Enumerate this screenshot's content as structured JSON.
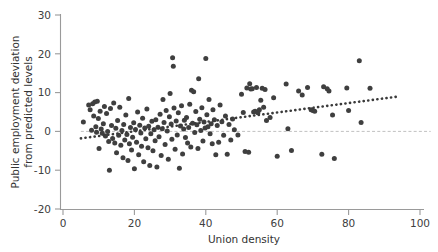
{
  "chart_data": {
    "type": "scatter",
    "title": "",
    "xlabel": "Union density",
    "ylabel": "Public employment deviation from predicted levels",
    "ylabel_line1": "Public employment deviation",
    "ylabel_line2": "from predicted levels",
    "xlim": [
      0,
      100
    ],
    "ylim": [
      -20,
      30
    ],
    "xticks": [
      0,
      20,
      40,
      60,
      80,
      100
    ],
    "yticks": [
      -20,
      -10,
      0,
      10,
      20,
      30
    ],
    "xtick_labels": [
      "0",
      "20",
      "40",
      "60",
      "80",
      "100"
    ],
    "ytick_labels": [
      "-20",
      "-10",
      "0",
      "10",
      "20",
      "30"
    ],
    "grid": false,
    "legend": "none",
    "marker_color": "#3f3f3f",
    "marker_size": 5,
    "reference_line": {
      "type": "horizontal-dashed",
      "y": 0,
      "color": "#b9b9b9",
      "x_start": 5,
      "x_end": 103
    },
    "trend_line": {
      "type": "dotted-linear-fit",
      "color": "#3a3a3a",
      "x_start": 5,
      "y_start": -1.8,
      "x_end": 94,
      "y_end": 9.0
    },
    "points": [
      [
        5.7,
        2.4
      ],
      [
        7.2,
        6.8
      ],
      [
        7.6,
        5.6
      ],
      [
        8.0,
        0.3
      ],
      [
        8.3,
        7.1
      ],
      [
        8.6,
        4.0
      ],
      [
        8.9,
        7.6
      ],
      [
        9.2,
        1.2
      ],
      [
        9.4,
        -0.2
      ],
      [
        9.6,
        7.8
      ],
      [
        9.9,
        3.3
      ],
      [
        10.1,
        -4.4
      ],
      [
        10.4,
        5.2
      ],
      [
        10.7,
        0.6
      ],
      [
        11.0,
        -0.5
      ],
      [
        11.3,
        2.0
      ],
      [
        11.6,
        6.4
      ],
      [
        11.9,
        -1.2
      ],
      [
        12.2,
        4.6
      ],
      [
        12.5,
        0.0
      ],
      [
        12.8,
        -2.6
      ],
      [
        13.0,
        -10.0
      ],
      [
        13.3,
        5.9
      ],
      [
        13.6,
        1.5
      ],
      [
        13.9,
        -1.8
      ],
      [
        14.2,
        7.3
      ],
      [
        14.5,
        -3.0
      ],
      [
        14.8,
        0.8
      ],
      [
        15.0,
        -5.5
      ],
      [
        15.3,
        2.8
      ],
      [
        15.6,
        -1.0
      ],
      [
        15.9,
        6.2
      ],
      [
        16.2,
        -3.6
      ],
      [
        16.5,
        0.2
      ],
      [
        16.8,
        -6.8
      ],
      [
        17.0,
        1.8
      ],
      [
        17.3,
        -2.2
      ],
      [
        17.6,
        4.2
      ],
      [
        17.9,
        -0.8
      ],
      [
        18.2,
        -7.5
      ],
      [
        18.4,
        8.5
      ],
      [
        18.6,
        -3.2
      ],
      [
        18.9,
        1.0
      ],
      [
        19.2,
        -4.8
      ],
      [
        19.5,
        -1.5
      ],
      [
        19.8,
        2.2
      ],
      [
        20.0,
        -9.6
      ],
      [
        20.3,
        0.5
      ],
      [
        20.6,
        -2.8
      ],
      [
        20.9,
        5.0
      ],
      [
        21.2,
        -6.0
      ],
      [
        21.5,
        1.6
      ],
      [
        21.8,
        -0.4
      ],
      [
        22.0,
        -3.8
      ],
      [
        22.3,
        3.4
      ],
      [
        22.6,
        -7.8
      ],
      [
        22.9,
        0.9
      ],
      [
        23.2,
        -1.9
      ],
      [
        23.5,
        5.8
      ],
      [
        23.8,
        -4.2
      ],
      [
        24.0,
        1.3
      ],
      [
        24.3,
        -8.8
      ],
      [
        24.6,
        -0.6
      ],
      [
        24.9,
        2.6
      ],
      [
        25.2,
        -5.0
      ],
      [
        25.5,
        0.4
      ],
      [
        25.8,
        -2.4
      ],
      [
        26.0,
        3.0
      ],
      [
        26.3,
        -9.2
      ],
      [
        26.6,
        1.1
      ],
      [
        26.9,
        -1.4
      ],
      [
        27.2,
        4.4
      ],
      [
        27.5,
        -6.2
      ],
      [
        27.8,
        0.7
      ],
      [
        28.0,
        8.2
      ],
      [
        28.3,
        2.3
      ],
      [
        28.6,
        -3.4
      ],
      [
        28.9,
        5.4
      ],
      [
        29.2,
        0.1
      ],
      [
        29.5,
        -7.2
      ],
      [
        29.8,
        3.8
      ],
      [
        30.0,
        9.8
      ],
      [
        30.3,
        1.9
      ],
      [
        30.5,
        -2.0
      ],
      [
        30.7,
        19.0
      ],
      [
        30.9,
        16.8
      ],
      [
        31.1,
        6.0
      ],
      [
        31.4,
        -4.6
      ],
      [
        31.7,
        2.7
      ],
      [
        32.0,
        -0.9
      ],
      [
        32.3,
        4.8
      ],
      [
        32.6,
        -9.5
      ],
      [
        32.9,
        1.4
      ],
      [
        33.2,
        6.6
      ],
      [
        33.5,
        -5.8
      ],
      [
        33.8,
        0.6
      ],
      [
        34.0,
        2.9
      ],
      [
        34.3,
        -1.6
      ],
      [
        34.6,
        3.6
      ],
      [
        34.9,
        -3.0
      ],
      [
        35.2,
        1.0
      ],
      [
        35.5,
        7.0
      ],
      [
        35.8,
        -4.0
      ],
      [
        36.0,
        10.6
      ],
      [
        36.3,
        2.1
      ],
      [
        36.6,
        10.2
      ],
      [
        36.9,
        -0.3
      ],
      [
        37.2,
        5.1
      ],
      [
        37.5,
        1.7
      ],
      [
        37.8,
        -4.4
      ],
      [
        38.0,
        13.6
      ],
      [
        38.3,
        3.1
      ],
      [
        38.6,
        0.2
      ],
      [
        38.9,
        6.1
      ],
      [
        39.2,
        -2.5
      ],
      [
        39.5,
        2.4
      ],
      [
        39.8,
        0.9
      ],
      [
        40.0,
        18.8
      ],
      [
        40.3,
        4.3
      ],
      [
        40.6,
        1.2
      ],
      [
        40.9,
        8.2
      ],
      [
        41.2,
        -0.6
      ],
      [
        41.5,
        2.0
      ],
      [
        41.8,
        -3.2
      ],
      [
        42.0,
        5.6
      ],
      [
        42.4,
        3.0
      ],
      [
        42.8,
        -6.0
      ],
      [
        43.2,
        1.5
      ],
      [
        43.6,
        -2.8
      ],
      [
        44.0,
        6.8
      ],
      [
        44.5,
        2.5
      ],
      [
        45.0,
        -1.0
      ],
      [
        45.5,
        4.0
      ],
      [
        46.0,
        -5.9
      ],
      [
        46.5,
        1.8
      ],
      [
        47.0,
        -2.2
      ],
      [
        47.5,
        3.2
      ],
      [
        48.0,
        0.4
      ],
      [
        49.0,
        -0.9
      ],
      [
        50.0,
        9.6
      ],
      [
        50.5,
        4.9
      ],
      [
        51.0,
        -5.2
      ],
      [
        51.5,
        11.2
      ],
      [
        52.0,
        -5.4
      ],
      [
        52.3,
        12.3
      ],
      [
        52.6,
        10.9
      ],
      [
        53.0,
        11.0
      ],
      [
        53.4,
        5.0
      ],
      [
        53.8,
        5.2
      ],
      [
        54.2,
        11.3
      ],
      [
        54.6,
        4.8
      ],
      [
        55.0,
        5.6
      ],
      [
        55.4,
        8.0
      ],
      [
        55.8,
        11.1
      ],
      [
        56.2,
        6.2
      ],
      [
        56.6,
        10.8
      ],
      [
        57.0,
        2.8
      ],
      [
        58.0,
        3.6
      ],
      [
        59.0,
        8.7
      ],
      [
        60.0,
        -6.4
      ],
      [
        62.5,
        12.2
      ],
      [
        63.0,
        0.7
      ],
      [
        64.0,
        -4.9
      ],
      [
        66.0,
        10.4
      ],
      [
        67.0,
        9.4
      ],
      [
        68.5,
        11.3
      ],
      [
        69.5,
        5.6
      ],
      [
        70.0,
        5.4
      ],
      [
        70.5,
        5.2
      ],
      [
        72.5,
        -5.9
      ],
      [
        73.0,
        11.5
      ],
      [
        74.0,
        11.0
      ],
      [
        74.5,
        10.4
      ],
      [
        75.5,
        4.2
      ],
      [
        76.0,
        -7.0
      ],
      [
        79.5,
        11.2
      ],
      [
        80.0,
        5.4
      ],
      [
        83.0,
        18.2
      ],
      [
        83.5,
        2.3
      ],
      [
        86.0,
        11.1
      ]
    ]
  }
}
